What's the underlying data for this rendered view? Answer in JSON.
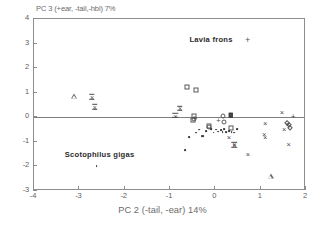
{
  "chart_data": {
    "type": "scatter",
    "title": "",
    "xlabel": "PC 2 (-tail, -ear) 14%",
    "ylabel": "PC 3 (+ear, -tail,-hbl) 7%",
    "xlim": [
      -4,
      2
    ],
    "ylim": [
      -3,
      4
    ],
    "xticks": [
      "-4",
      "-3",
      "-2",
      "-1",
      "0",
      "1",
      "2"
    ],
    "xtick_values": [
      -4,
      -3,
      -2,
      -1,
      0,
      1,
      2
    ],
    "yticks": [
      "4",
      "3",
      "2",
      "1",
      "0",
      "-1",
      "-2",
      "-3"
    ],
    "ytick_values": [
      4,
      3,
      2,
      1,
      0,
      -1,
      -2,
      -3
    ],
    "grid": false,
    "zero_line_y": 0,
    "legend_position": "inside-top",
    "annotations": [
      {
        "text": "Lavia frons",
        "x": -0.55,
        "y": 3.15,
        "marker": "plus",
        "bold": true
      },
      {
        "text": "Scotophilus gigas",
        "x": -3.3,
        "y": -1.55,
        "marker": "none",
        "bold": true
      }
    ],
    "series": [
      {
        "name": "triangle",
        "marker": "triangle",
        "points": [
          [
            -3.12,
            0.85
          ],
          [
            1.22,
            -2.4
          ]
        ]
      },
      {
        "name": "star-x",
        "marker": "starx",
        "points": [
          [
            -2.72,
            0.84
          ],
          [
            -2.66,
            0.43
          ],
          [
            -0.88,
            0.07
          ],
          [
            -0.78,
            0.37
          ],
          [
            0.42,
            -1.12
          ]
        ]
      },
      {
        "name": "square-open",
        "marker": "square",
        "points": [
          [
            -0.62,
            1.25
          ],
          [
            -0.42,
            1.1
          ],
          [
            -0.48,
            0.06
          ],
          [
            -0.49,
            -0.12
          ],
          [
            -0.13,
            -0.36
          ],
          [
            0.34,
            -0.42
          ]
        ]
      },
      {
        "name": "square-filled",
        "marker": "square-filled",
        "points": [
          [
            0.34,
            0.08
          ]
        ]
      },
      {
        "name": "circle-open",
        "marker": "circle",
        "points": [
          [
            -0.46,
            -0.05
          ],
          [
            0.18,
            0.05
          ],
          [
            0.2,
            -0.2
          ],
          [
            -0.15,
            -0.38
          ]
        ]
      },
      {
        "name": "diamond-open",
        "marker": "diamond",
        "points": [
          [
            1.62,
            -0.3
          ],
          [
            1.64,
            -0.42
          ],
          [
            1.58,
            -0.25
          ]
        ]
      },
      {
        "name": "plus",
        "marker": "plus",
        "points": [
          [
            -0.45,
            -0.08
          ],
          [
            0.07,
            -0.17
          ],
          [
            1.72,
            0.02
          ]
        ]
      },
      {
        "name": "cross-x",
        "marker": "x",
        "points": [
          [
            1.47,
            0.18
          ],
          [
            1.1,
            -0.27
          ],
          [
            1.08,
            -0.72
          ],
          [
            1.1,
            -0.86
          ],
          [
            1.52,
            -0.5
          ],
          [
            1.6,
            -0.33
          ],
          [
            1.62,
            -1.12
          ],
          [
            0.72,
            -1.52
          ],
          [
            0.42,
            -1.12
          ],
          [
            0.3,
            -0.85
          ]
        ]
      },
      {
        "name": "small-dot",
        "marker": "dot",
        "points": [
          [
            -2.62,
            -1.98
          ],
          [
            -0.66,
            -1.35
          ],
          [
            -0.57,
            -0.82
          ],
          [
            -0.42,
            -0.62
          ],
          [
            -0.3,
            -0.77
          ],
          [
            -0.26,
            -0.78
          ],
          [
            -0.2,
            -0.55
          ],
          [
            -0.1,
            -0.48
          ],
          [
            -0.04,
            -0.62
          ],
          [
            0.02,
            -0.5
          ],
          [
            0.06,
            -0.58
          ],
          [
            0.12,
            -0.52
          ],
          [
            0.16,
            -0.6
          ],
          [
            0.2,
            -0.47
          ],
          [
            0.24,
            -0.6
          ],
          [
            0.3,
            -0.56
          ],
          [
            0.36,
            -0.6
          ],
          [
            0.42,
            -0.62
          ],
          [
            0.48,
            -0.48
          ],
          [
            -0.36,
            -0.5
          ]
        ]
      }
    ]
  },
  "axes": {
    "xlabel": "PC 2 (-tail, -ear) 14%",
    "ylabel": "PC 3 (+ear, -tail,-hbl) 7%"
  }
}
